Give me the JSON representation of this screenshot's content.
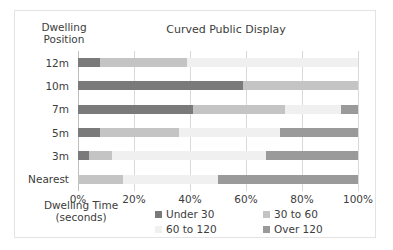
{
  "chart_data": {
    "type": "bar",
    "orientation": "horizontal",
    "stacked": true,
    "stack_mode": "percent",
    "title": "Curved Public Display",
    "xlabel": "Dwelling Time\n(seconds)",
    "ylabel": "Dwelling\nPosition",
    "categories": [
      "12m",
      "10m",
      "7m",
      "5m",
      "3m",
      "Nearest"
    ],
    "xlim": [
      0,
      100
    ],
    "xticks": [
      0,
      20,
      40,
      60,
      80,
      100
    ],
    "xtick_labels": [
      "0%",
      "20%",
      "40%",
      "60%",
      "80%",
      "100%"
    ],
    "grid": true,
    "legend_position": "bottom",
    "series": [
      {
        "name": "Under 30",
        "color": "#7a7a7a",
        "values": [
          8,
          59,
          41,
          8,
          4,
          0
        ]
      },
      {
        "name": "30 to 60",
        "color": "#c4c4c4",
        "values": [
          31,
          41,
          33,
          28,
          8,
          16
        ]
      },
      {
        "name": "60 to 120",
        "color": "#f0f0f0",
        "values": [
          61,
          0,
          20,
          36,
          55,
          34
        ]
      },
      {
        "name": "Over 120",
        "color": "#9a9a9a",
        "values": [
          0,
          0,
          6,
          28,
          33,
          50
        ]
      }
    ]
  },
  "colors": {
    "card_border": "#e3e3e3",
    "gridline": "#d9d9d9",
    "axis": "#bfbfbf",
    "text": "#3c3c3c",
    "background": "#ffffff"
  }
}
